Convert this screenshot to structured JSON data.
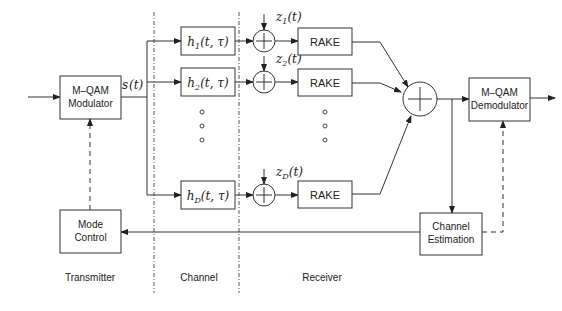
{
  "diagram": {
    "type": "block-diagram",
    "title": "",
    "transmitter": {
      "modulator": {
        "line1": "M–QAM",
        "line2": "Modulator"
      },
      "mode_control": {
        "line1": "Mode",
        "line2": "Control"
      },
      "signal_label": {
        "base": "s",
        "arg": "(t)"
      }
    },
    "channel": {
      "branches": [
        {
          "base": "h",
          "sub": "1",
          "arg": "(t, τ)"
        },
        {
          "base": "h",
          "sub": "2",
          "arg": "(t, τ)"
        },
        {
          "base": "h",
          "sub": "D",
          "arg": "(t, τ)"
        }
      ],
      "ellipsis": "…"
    },
    "receiver": {
      "noise": [
        {
          "base": "z",
          "sub": "1",
          "arg": "(t)"
        },
        {
          "base": "z",
          "sub": "2",
          "arg": "(t)"
        },
        {
          "base": "z",
          "sub": "D",
          "arg": "(t)"
        }
      ],
      "rake_label": "RAKE",
      "demodulator": {
        "line1": "M–QAM",
        "line2": "Demodulator"
      },
      "channel_estimation": {
        "line1": "Channel",
        "line2": "Estimation"
      }
    },
    "section_labels": {
      "transmitter": "Transmitter",
      "channel": "Channel",
      "receiver": "Receiver"
    }
  }
}
